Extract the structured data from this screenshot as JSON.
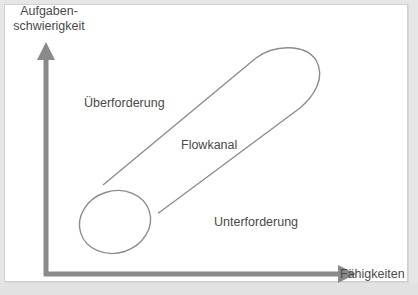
{
  "diagram": {
    "type": "flow-channel",
    "axes": {
      "y_label_line1": "Aufgaben-",
      "y_label_line2": "schwierigkeit",
      "x_label": "Fähigkeiten"
    },
    "regions": {
      "above": "Überforderung",
      "channel": "Flowkanal",
      "below": "Unterforderung"
    },
    "colors": {
      "axis": "#8a8a8a",
      "outline": "#8c8c8c",
      "text": "#4a4a4a",
      "panel": "#ffffff",
      "background": "#e6e6e6"
    }
  },
  "footer": {
    "caption": ""
  }
}
